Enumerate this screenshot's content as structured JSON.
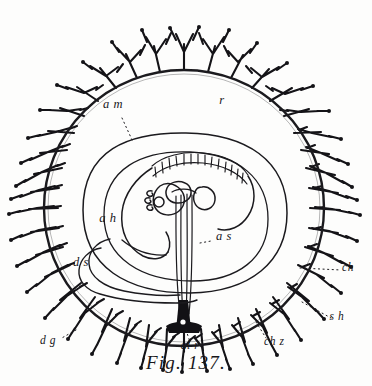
{
  "figure": {
    "caption": "Fig. 137.",
    "title": "Fig. 137.",
    "background_color": "#fdfdfc",
    "ink_color": "#1b1a1e"
  },
  "labels": {
    "amnion": "a m",
    "chorion_space": "r",
    "allantois_head": "a h",
    "amniotic_sac": "a s",
    "yolk_sac": "d s",
    "chorion": "ch",
    "villus_sheath": "s h",
    "decidua_glands": "d g",
    "allantoic_stalk": "al r",
    "chorion_zone": "ch z"
  },
  "label_positions": {
    "amnion": {
      "x": 113,
      "y": 108
    },
    "chorion_space": {
      "x": 222,
      "y": 104
    },
    "allantois_head": {
      "x": 108,
      "y": 222
    },
    "amniotic_sac": {
      "x": 216,
      "y": 240
    },
    "yolk_sac": {
      "x": 81,
      "y": 266
    },
    "chorion": {
      "x": 348,
      "y": 271
    },
    "villus_sheath": {
      "x": 337,
      "y": 320
    },
    "decidua_glands": {
      "x": 48,
      "y": 344
    },
    "allantoic_stalk": {
      "x": 190,
      "y": 349
    },
    "chorion_zone": {
      "x": 264,
      "y": 345
    }
  },
  "geometry": {
    "chorion_center": {
      "cx": 184,
      "cy": 208
    },
    "chorion_radius_x": 140,
    "chorion_radius_y": 138,
    "villi_count": 54,
    "amnion_outer_radius_x": 101,
    "amnion_outer_radius_y": 94,
    "amnion_inner_radius_x": 78,
    "amnion_inner_radius_y": 72,
    "somite_count": 16
  }
}
